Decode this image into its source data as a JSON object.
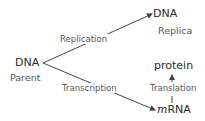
{
  "diagram": {
    "title": "",
    "nodes": {
      "parent": {
        "label": "DNA",
        "sublabel": "Parent"
      },
      "replica": {
        "label": "DNA",
        "sublabel": "Replica"
      },
      "mrna": {
        "prefix": "m",
        "label": "RNA"
      },
      "protein": {
        "label": "protein"
      }
    },
    "edges": {
      "replication": {
        "from": "parent",
        "to": "replica",
        "label": "Replication"
      },
      "transcription": {
        "from": "parent",
        "to": "mrna",
        "label": "Transcription"
      },
      "translation": {
        "from": "mrna",
        "to": "protein",
        "label": "Translation"
      }
    },
    "colors": {
      "line": "#444444",
      "text": "#2a2a2a",
      "sublabel": "#555555"
    }
  }
}
